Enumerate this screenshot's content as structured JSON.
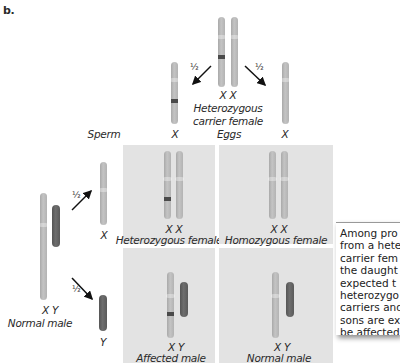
{
  "figure_label": "b.",
  "mother": {
    "chromosome_labels": "X  X",
    "title_line1": "Heterozygous",
    "title_line2": "carrier female"
  },
  "father": {
    "chromosome_labels": "X  Y",
    "title": "Normal male"
  },
  "gametes": {
    "sperm_header": "Sperm",
    "eggs_header": "Eggs",
    "egg_left_label": "X",
    "egg_right_label": "X",
    "sperm_x_label": "X",
    "sperm_y_label": "Y",
    "probability": "½"
  },
  "punnett": [
    {
      "genotype": "X  X",
      "phenotype": "Heterozygous female"
    },
    {
      "genotype": "X  X",
      "phenotype": "Homozygous female"
    },
    {
      "genotype": "X  Y",
      "phenotype": "Affected male"
    },
    {
      "genotype": "X  Y",
      "phenotype": "Normal male"
    }
  ],
  "note": {
    "text": "Among pro\nfrom a hete\ncarrier fem\nthe daught\nexpected t\nheterozygo\ncarriers and\nsons are ex\nbe affected"
  },
  "colors": {
    "x_chromosome": "#b8b8b8",
    "y_chromosome": "#606060",
    "mutation_band": "#4a4a4a",
    "panel_bg": "#e3e3e3"
  }
}
